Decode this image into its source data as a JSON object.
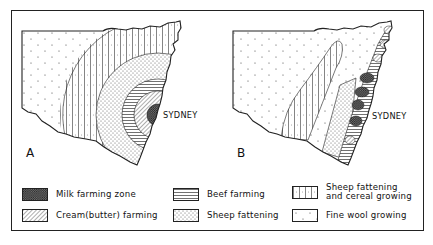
{
  "figure": {
    "maps": [
      {
        "id": "A",
        "label": "A",
        "city_label": "SYDNEY"
      },
      {
        "id": "B",
        "label": "B",
        "city_label": "SYDNEY"
      }
    ],
    "legend": {
      "items": [
        {
          "key": "milk",
          "label": "Milk farming zone",
          "pattern": "dense-crosshatch"
        },
        {
          "key": "cream",
          "label": "Cream(butter) farming",
          "pattern": "diagonal-hatch"
        },
        {
          "key": "beef",
          "label": "Beef farming",
          "pattern": "horizontal-lines"
        },
        {
          "key": "sheep_fattening",
          "label": "Sheep fattening",
          "pattern": "dense-dots"
        },
        {
          "key": "sheep_cereal",
          "label": "Sheep fattening\n and cereal growing",
          "pattern": "vertical-lines-dots"
        },
        {
          "key": "fine_wool",
          "label": "Fine wool growing",
          "pattern": "sparse-dots"
        }
      ]
    },
    "colors": {
      "ink": "#222222",
      "paper": "#ffffff"
    }
  }
}
